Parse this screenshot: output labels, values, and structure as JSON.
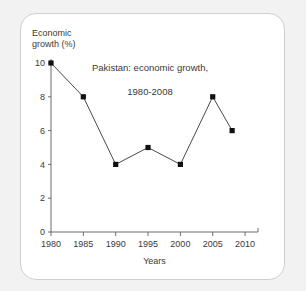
{
  "figure": {
    "y_axis_label": "Economic\ngrowth (%)",
    "x_axis_label": "Years",
    "title_line1": "Pakistan: economic growth,",
    "title_line2": "1980-2008"
  },
  "colors": {
    "page_background": "#f2f2f2",
    "card_background": "#ffffff",
    "card_border": "#cfcfcf",
    "axis": "#6b6b6b",
    "line": "#333333",
    "marker": "#111111",
    "text": "#3a3a3a"
  },
  "chart_data": {
    "type": "line",
    "title": "Pakistan: economic growth, 1980-2008",
    "xlabel": "Years",
    "ylabel": "Economic growth (%)",
    "x": [
      1980,
      1985,
      1990,
      1995,
      2000,
      2005,
      2008
    ],
    "values": [
      10,
      8,
      4,
      5,
      4,
      8,
      6
    ],
    "xlim": [
      1980,
      2012
    ],
    "ylim": [
      0,
      10
    ],
    "xticks": [
      1980,
      1985,
      1990,
      1995,
      2000,
      2005,
      2010
    ],
    "xticklabels": [
      "1980",
      "1985",
      "1990",
      "1995",
      "2000",
      "2005",
      "2010"
    ],
    "yticks": [
      0,
      2,
      4,
      6,
      8,
      10
    ],
    "yticklabels": [
      "0",
      "2",
      "4",
      "6",
      "8",
      "10"
    ],
    "grid": false,
    "legend": false,
    "marker": "square",
    "series": [
      {
        "name": "Economic growth (%)",
        "points": [
          {
            "year": 1980,
            "value": 10
          },
          {
            "year": 1985,
            "value": 8
          },
          {
            "year": 1990,
            "value": 4
          },
          {
            "year": 1995,
            "value": 5
          },
          {
            "year": 2000,
            "value": 4
          },
          {
            "year": 2005,
            "value": 8
          },
          {
            "year": 2008,
            "value": 6
          }
        ]
      }
    ]
  }
}
